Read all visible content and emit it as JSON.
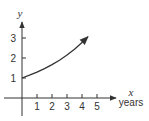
{
  "chart_data": {
    "type": "line",
    "title": "",
    "xlabel": "x",
    "xlabel_units": "years",
    "ylabel": "y",
    "x_ticks": [
      "1",
      "2",
      "3",
      "4",
      "5"
    ],
    "y_ticks": [
      "1",
      "2",
      "3"
    ],
    "xlim": [
      0,
      5.5
    ],
    "ylim": [
      0,
      3.5
    ],
    "grid": false,
    "legend": null,
    "series": [
      {
        "name": "exponential growth",
        "description": "increasing curve starting at (0,1), ending with arrow near (4.4, 3.1)",
        "x": [
          0,
          0.5,
          1,
          1.5,
          2,
          2.5,
          3,
          3.5,
          4,
          4.4
        ],
        "values": [
          1.0,
          1.14,
          1.29,
          1.47,
          1.67,
          1.89,
          2.15,
          2.44,
          2.77,
          3.07
        ]
      }
    ]
  },
  "axes": {
    "x_label": "x",
    "x_units": "years",
    "y_label": "y",
    "x_ticks": [
      "1",
      "2",
      "3",
      "4",
      "5"
    ],
    "y_ticks": [
      "1",
      "2",
      "3"
    ]
  },
  "colors": {
    "ink": "#333333",
    "background": "#ffffff"
  }
}
